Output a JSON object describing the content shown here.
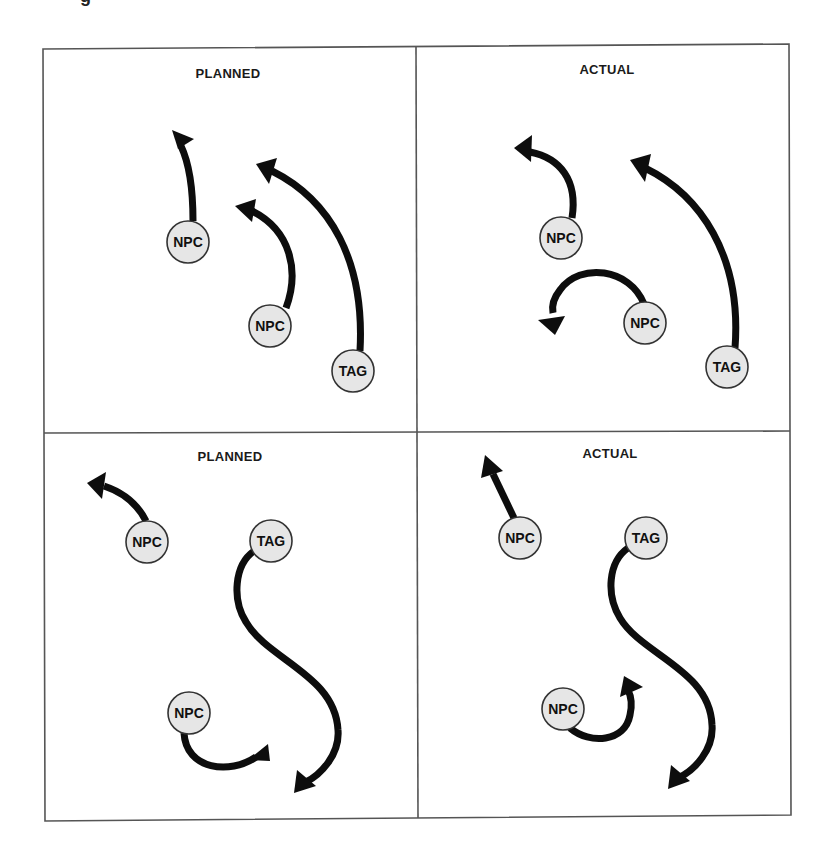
{
  "figure": {
    "title_fragment": "g",
    "panels": [
      {
        "id": "top-left",
        "title": "PLANNED",
        "nodes": [
          {
            "label": "NPC",
            "x": 188,
            "y": 242
          },
          {
            "label": "NPC",
            "x": 270,
            "y": 326
          },
          {
            "label": "TAG",
            "x": 353,
            "y": 371
          }
        ]
      },
      {
        "id": "top-right",
        "title": "ACTUAL",
        "nodes": [
          {
            "label": "NPC",
            "x": 561,
            "y": 238
          },
          {
            "label": "NPC",
            "x": 645,
            "y": 323
          },
          {
            "label": "TAG",
            "x": 727,
            "y": 367
          }
        ]
      },
      {
        "id": "bottom-left",
        "title": "PLANNED",
        "nodes": [
          {
            "label": "NPC",
            "x": 147,
            "y": 542
          },
          {
            "label": "TAG",
            "x": 271,
            "y": 541
          },
          {
            "label": "NPC",
            "x": 189,
            "y": 713
          }
        ]
      },
      {
        "id": "bottom-right",
        "title": "ACTUAL",
        "nodes": [
          {
            "label": "NPC",
            "x": 520,
            "y": 538
          },
          {
            "label": "TAG",
            "x": 646,
            "y": 538
          },
          {
            "label": "NPC",
            "x": 563,
            "y": 709
          }
        ]
      }
    ]
  },
  "colors": {
    "node_fill": "#e6e6e6",
    "arrow": "#0d0d0d",
    "frame": "#555555"
  }
}
